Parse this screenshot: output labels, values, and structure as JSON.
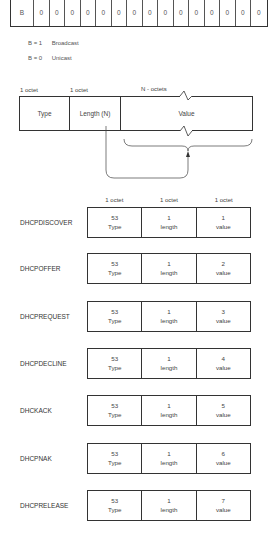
{
  "flags_field": {
    "cells": [
      "B",
      "0",
      "0",
      "0",
      "0",
      "0",
      "0",
      "0",
      "0",
      "0",
      "0",
      "0",
      "0",
      "0",
      "0",
      "0"
    ]
  },
  "legend": [
    {
      "key": "B = 1",
      "meaning": "Broadcast"
    },
    {
      "key": "B = 0",
      "meaning": "Unicast"
    }
  ],
  "tlv": {
    "labels": [
      "1 octet",
      "1 octet",
      "N - octets"
    ],
    "cells": [
      "Type",
      "Length (N)",
      "Value"
    ]
  },
  "message_types": {
    "headers": [
      "1 octet",
      "1 octet",
      "1 octet"
    ],
    "rows": [
      {
        "name": "DHCPDISCOVER",
        "type_code": "53",
        "type_label": "Type",
        "length": "1",
        "length_label": "length",
        "value": "1",
        "value_label": "value"
      },
      {
        "name": "DHCPOFFER",
        "type_code": "53",
        "type_label": "Type",
        "length": "1",
        "length_label": "length",
        "value": "2",
        "value_label": "value"
      },
      {
        "name": "DHCPREQUEST",
        "type_code": "53",
        "type_label": "Type",
        "length": "1",
        "length_label": "length",
        "value": "3",
        "value_label": "value"
      },
      {
        "name": "DHCPDECLINE",
        "type_code": "53",
        "type_label": "Type",
        "length": "1",
        "length_label": "length",
        "value": "4",
        "value_label": "value"
      },
      {
        "name": "DHCKACK",
        "type_code": "53",
        "type_label": "Type",
        "length": "1",
        "length_label": "length",
        "value": "5",
        "value_label": "value"
      },
      {
        "name": "DHCPNAK",
        "type_code": "53",
        "type_label": "Type",
        "length": "1",
        "length_label": "length",
        "value": "6",
        "value_label": "value"
      },
      {
        "name": "DHCPRELEASE",
        "type_code": "53",
        "type_label": "Type",
        "length": "1",
        "length_label": "length",
        "value": "7",
        "value_label": "value"
      }
    ]
  }
}
